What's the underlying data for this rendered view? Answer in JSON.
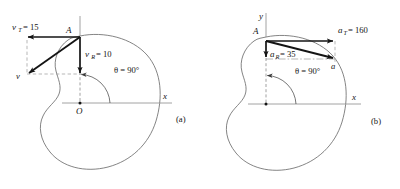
{
  "figure": {
    "background_color": "#ffffff",
    "ink_color": "#141414",
    "axis_color": "#8a8a8a",
    "cam_outline_color": "#6e6e6e",
    "dash_color": "#9a9a9a",
    "panels": [
      {
        "id": "a",
        "caption": "(a)",
        "quantity": "velocity",
        "point_label": "A",
        "origin_label": "O",
        "x_axis_label": "x",
        "y_axis_label": "",
        "angle_label": "θ = 90°",
        "angle_value": 90,
        "vectors": [
          {
            "name": "tangential",
            "symbol": "v",
            "subscript": "T",
            "label": "v_T = 15",
            "label_head": "v",
            "label_sub": "T",
            "label_value": "= 15",
            "magnitude": 15,
            "direction": "negative-x"
          },
          {
            "name": "radial",
            "symbol": "v",
            "subscript": "R",
            "label": "v_R = 10",
            "label_head": "v",
            "label_sub": "R",
            "label_value": "= 10",
            "magnitude": 10,
            "direction": "negative-y"
          },
          {
            "name": "resultant",
            "symbol": "v",
            "subscript": "",
            "label": "v",
            "label_head": "v",
            "label_sub": "",
            "label_value": "",
            "magnitude": null,
            "direction": "down-left"
          }
        ]
      },
      {
        "id": "b",
        "caption": "(b)",
        "quantity": "acceleration",
        "point_label": "A",
        "origin_label": "",
        "x_axis_label": "x",
        "y_axis_label": "y",
        "angle_label": "θ = 90°",
        "angle_value": 90,
        "vectors": [
          {
            "name": "tangential",
            "symbol": "a",
            "subscript": "T",
            "label": "a_T = 160",
            "label_head": "a",
            "label_sub": "T",
            "label_value": "= 160",
            "magnitude": 160,
            "direction": "positive-x"
          },
          {
            "name": "radial",
            "symbol": "a",
            "subscript": "R",
            "label": "a_R = 35",
            "label_head": "a",
            "label_sub": "R",
            "label_value": "= 35",
            "magnitude": 35,
            "direction": "negative-y"
          },
          {
            "name": "resultant",
            "symbol": "a",
            "subscript": "",
            "label": "a",
            "label_head": "a",
            "label_sub": "",
            "label_value": "",
            "magnitude": null,
            "direction": "down-right"
          }
        ]
      }
    ]
  }
}
